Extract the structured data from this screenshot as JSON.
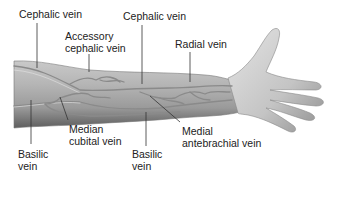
{
  "figure": {
    "colors": {
      "background": "#ffffff",
      "skin_light": "#d9d9d9",
      "skin_mid": "#a9a9a9",
      "skin_dark": "#6f6f6f",
      "vein": "#8a8a8a",
      "vein_highlight": "#e6e6e6",
      "leader_line": "#333333",
      "text": "#222222"
    },
    "labels": [
      {
        "id": "cephalic-vein-upper",
        "text": "Cephalic vein"
      },
      {
        "id": "accessory-cephalic-vein",
        "text": "Accessory\ncephalic vein"
      },
      {
        "id": "cephalic-vein-forearm",
        "text": "Cephalic vein"
      },
      {
        "id": "radial-vein",
        "text": "Radial vein"
      },
      {
        "id": "median-cubital-vein",
        "text": "Median\ncubital vein"
      },
      {
        "id": "basilic-vein-upper",
        "text": "Basilic\nvein"
      },
      {
        "id": "basilic-vein-forearm",
        "text": "Basilic\nvein"
      },
      {
        "id": "medial-antebrachial-vein",
        "text": "Medial\nantebrachial vein"
      }
    ]
  }
}
